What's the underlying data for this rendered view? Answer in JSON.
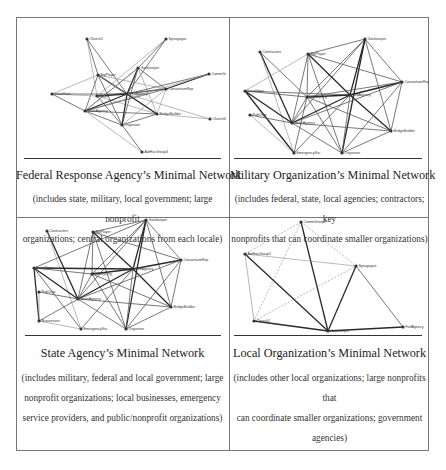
{
  "figure": {
    "panels": [
      {
        "id": "federal",
        "title": "Federal Response Agency’s Minimal Network",
        "description_lines": [
          "(includes state, military, local government; large nonprofit",
          "organizations; central organizations from each locale)"
        ],
        "nodes": [
          {
            "label": "Church1",
            "x": 67,
            "y": 22
          },
          {
            "label": "Synagogue",
            "x": 146,
            "y": 22
          },
          {
            "label": "Gatekeeper",
            "x": 118,
            "y": 51
          },
          {
            "label": "CommGroup4",
            "x": 189,
            "y": 57
          },
          {
            "label": "BigPlayer",
            "x": 78,
            "y": 58
          },
          {
            "label": "ConsortiumRep",
            "x": 146,
            "y": 72
          },
          {
            "label": "LocalGovt",
            "x": 32,
            "y": 77
          },
          {
            "label": "Mayor",
            "x": 77,
            "y": 79
          },
          {
            "label": "FedAgency",
            "x": 107,
            "y": 77
          },
          {
            "label": "StateAgency",
            "x": 65,
            "y": 94
          },
          {
            "label": "BridgeBuilder",
            "x": 137,
            "y": 97
          },
          {
            "label": "Church6",
            "x": 190,
            "y": 102
          },
          {
            "label": "Organizer",
            "x": 102,
            "y": 108
          },
          {
            "label": "AidHocGroup3",
            "x": 122,
            "y": 135
          }
        ],
        "edges": [
          [
            0,
            4,
            1
          ],
          [
            0,
            8,
            1
          ],
          [
            0,
            7,
            0
          ],
          [
            1,
            2,
            1
          ],
          [
            1,
            8,
            1
          ],
          [
            1,
            7,
            0
          ],
          [
            2,
            8,
            2
          ],
          [
            2,
            12,
            1
          ],
          [
            2,
            9,
            1
          ],
          [
            2,
            5,
            1
          ],
          [
            2,
            10,
            0
          ],
          [
            3,
            5,
            2
          ],
          [
            3,
            8,
            1
          ],
          [
            3,
            9,
            0
          ],
          [
            4,
            8,
            2
          ],
          [
            4,
            9,
            1
          ],
          [
            4,
            12,
            1
          ],
          [
            4,
            10,
            0
          ],
          [
            4,
            5,
            0
          ],
          [
            4,
            6,
            0
          ],
          [
            6,
            8,
            1
          ],
          [
            6,
            9,
            1
          ],
          [
            6,
            7,
            0
          ],
          [
            7,
            8,
            2
          ],
          [
            7,
            5,
            1
          ],
          [
            7,
            12,
            1
          ],
          [
            7,
            10,
            0
          ],
          [
            8,
            9,
            2
          ],
          [
            8,
            10,
            2
          ],
          [
            8,
            12,
            2
          ],
          [
            8,
            5,
            1
          ],
          [
            8,
            11,
            0
          ],
          [
            9,
            10,
            1
          ],
          [
            9,
            12,
            1
          ],
          [
            9,
            5,
            1
          ],
          [
            10,
            12,
            1
          ],
          [
            10,
            5,
            0
          ],
          [
            10,
            11,
            0
          ],
          [
            12,
            13,
            1
          ],
          [
            9,
            13,
            0
          ],
          [
            5,
            12,
            0
          ],
          [
            2,
            9,
            0
          ]
        ]
      },
      {
        "id": "military",
        "title": "Military Organization’s Minimal Network",
        "description_lines": [
          "(includes federal, state, local agencies; contractors; key",
          "nonprofits that can coordinate smaller organizations)"
        ],
        "nodes": [
          {
            "label": "Gatekeeper",
            "x": 135,
            "y": 22
          },
          {
            "label": "Contractors",
            "x": 30,
            "y": 35
          },
          {
            "label": "BigPlayer",
            "x": 78,
            "y": 37
          },
          {
            "label": "ConsortiumRep",
            "x": 172,
            "y": 65
          },
          {
            "label": "LocalGovt",
            "x": 15,
            "y": 74
          },
          {
            "label": "MilitaryOrg",
            "x": 77,
            "y": 80
          },
          {
            "label": "FedAgency",
            "x": 120,
            "y": 78
          },
          {
            "label": "PubOrgs",
            "x": 20,
            "y": 98
          },
          {
            "label": "StateAgency",
            "x": 62,
            "y": 106
          },
          {
            "label": "BridgeBuilder",
            "x": 161,
            "y": 114
          },
          {
            "label": "EmergencySvc",
            "x": 64,
            "y": 136
          },
          {
            "label": "Organizer",
            "x": 112,
            "y": 136
          }
        ],
        "edges": [
          [
            0,
            2,
            1
          ],
          [
            0,
            5,
            1
          ],
          [
            0,
            6,
            2
          ],
          [
            0,
            8,
            1
          ],
          [
            0,
            11,
            2
          ],
          [
            0,
            3,
            1
          ],
          [
            0,
            9,
            1
          ],
          [
            1,
            8,
            2
          ],
          [
            1,
            10,
            0
          ],
          [
            1,
            5,
            1
          ],
          [
            2,
            5,
            1
          ],
          [
            2,
            6,
            2
          ],
          [
            2,
            8,
            1
          ],
          [
            2,
            11,
            1
          ],
          [
            2,
            3,
            1
          ],
          [
            2,
            4,
            0
          ],
          [
            4,
            8,
            2
          ],
          [
            4,
            10,
            2
          ],
          [
            4,
            6,
            1
          ],
          [
            4,
            5,
            1
          ],
          [
            5,
            6,
            2
          ],
          [
            5,
            8,
            1
          ],
          [
            5,
            11,
            1
          ],
          [
            5,
            10,
            1
          ],
          [
            5,
            9,
            1
          ],
          [
            6,
            8,
            2
          ],
          [
            6,
            3,
            2
          ],
          [
            6,
            9,
            2
          ],
          [
            6,
            11,
            1
          ],
          [
            6,
            10,
            1
          ],
          [
            7,
            8,
            1
          ],
          [
            7,
            10,
            0
          ],
          [
            8,
            3,
            1
          ],
          [
            8,
            11,
            1
          ],
          [
            8,
            9,
            1
          ],
          [
            3,
            11,
            1
          ],
          [
            3,
            9,
            1
          ],
          [
            9,
            11,
            1
          ],
          [
            3,
            5,
            1
          ]
        ]
      },
      {
        "id": "state",
        "title": "State Agency’s Minimal Network",
        "description_lines": [
          "(includes military, federal and local government; large",
          "nonprofit organizations; local businesses, emergency",
          "service providers, and public/nonprofit organizations)"
        ],
        "nodes": [
          {
            "label": "Gatekeeper",
            "x": 126,
            "y": 2
          },
          {
            "label": "Contractors",
            "x": 27,
            "y": 13
          },
          {
            "label": "BigPlayer",
            "x": 73,
            "y": 14
          },
          {
            "label": "ConsortiumRep",
            "x": 161,
            "y": 42
          },
          {
            "label": "LocalGovt",
            "x": 14,
            "y": 50
          },
          {
            "label": "MilitaryOrg",
            "x": 72,
            "y": 56
          },
          {
            "label": "FedAgency",
            "x": 113,
            "y": 51
          },
          {
            "label": "PubOrgs",
            "x": 19,
            "y": 74
          },
          {
            "label": "StateAgency",
            "x": 58,
            "y": 81
          },
          {
            "label": "BridgeBuilder",
            "x": 151,
            "y": 89
          },
          {
            "label": "Businesses",
            "x": 19,
            "y": 103
          },
          {
            "label": "EmergencySvc",
            "x": 61,
            "y": 111
          },
          {
            "label": "Organizer",
            "x": 106,
            "y": 111
          }
        ],
        "edges": [
          [
            0,
            2,
            1
          ],
          [
            0,
            5,
            1
          ],
          [
            0,
            6,
            2
          ],
          [
            0,
            8,
            1
          ],
          [
            0,
            12,
            2
          ],
          [
            0,
            3,
            1
          ],
          [
            0,
            9,
            1
          ],
          [
            0,
            4,
            1
          ],
          [
            1,
            8,
            2
          ],
          [
            1,
            11,
            0
          ],
          [
            2,
            5,
            1
          ],
          [
            2,
            6,
            2
          ],
          [
            2,
            8,
            1
          ],
          [
            2,
            12,
            1
          ],
          [
            2,
            3,
            1
          ],
          [
            4,
            8,
            2
          ],
          [
            4,
            10,
            2
          ],
          [
            4,
            11,
            1
          ],
          [
            4,
            6,
            2
          ],
          [
            4,
            5,
            1
          ],
          [
            5,
            6,
            2
          ],
          [
            5,
            8,
            1
          ],
          [
            5,
            12,
            1
          ],
          [
            5,
            9,
            1
          ],
          [
            6,
            8,
            2
          ],
          [
            6,
            3,
            2
          ],
          [
            6,
            9,
            2
          ],
          [
            6,
            12,
            1
          ],
          [
            6,
            11,
            1
          ],
          [
            7,
            8,
            1
          ],
          [
            7,
            10,
            0
          ],
          [
            8,
            3,
            1
          ],
          [
            8,
            12,
            1
          ],
          [
            8,
            9,
            1
          ],
          [
            3,
            12,
            1
          ],
          [
            3,
            9,
            1
          ],
          [
            9,
            12,
            1
          ],
          [
            10,
            8,
            1
          ],
          [
            10,
            11,
            0
          ]
        ]
      },
      {
        "id": "local",
        "title": "Local Organization’s Minimal Network",
        "description_lines": [
          "(includes other local organizations; large nonprofits that",
          "can coordinate smaller organizations; government",
          "agencies)"
        ],
        "nodes": [
          {
            "label": "CommGroup2",
            "x": 71,
            "y": 4
          },
          {
            "label": "AidHocGroup2",
            "x": 15,
            "y": 36
          },
          {
            "label": "Synagogue",
            "x": 126,
            "y": 48
          },
          {
            "label": "Church2",
            "x": 24,
            "y": 103
          },
          {
            "label": "Gatekeeper",
            "x": 98,
            "y": 113
          },
          {
            "label": "FedAgency",
            "x": 173,
            "y": 109
          }
        ],
        "edges": [
          [
            0,
            4,
            2
          ],
          [
            0,
            1,
            3
          ],
          [
            0,
            3,
            3
          ],
          [
            0,
            2,
            3
          ],
          [
            1,
            4,
            2
          ],
          [
            1,
            3,
            0
          ],
          [
            1,
            2,
            0
          ],
          [
            3,
            2,
            3
          ],
          [
            3,
            4,
            2
          ],
          [
            2,
            4,
            2
          ],
          [
            2,
            5,
            1
          ],
          [
            4,
            5,
            2
          ]
        ]
      }
    ],
    "colors": {
      "border": "#777777",
      "rule": "#333333",
      "edge_heavy": "#2a2a2a",
      "edge_medium": "#555555",
      "edge_light": "#8a8a8a",
      "node": "#333333"
    }
  }
}
